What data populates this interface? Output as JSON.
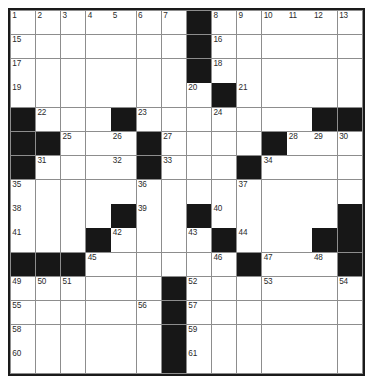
{
  "puzzle": {
    "title": "Crossword Grid",
    "type": "crossword",
    "columns": 14,
    "rows": 15,
    "colors": {
      "block": "#171717",
      "cell": "#ffffff",
      "gridline": "#8d8d8d",
      "border": "#1a1a1a",
      "number_text": "#2b2b2b"
    },
    "legend": {
      "block_label": "blocked square",
      "open_label": "open square"
    },
    "grid": [
      [
        "1",
        "2",
        "3",
        "4",
        "5",
        "6",
        "7",
        "#",
        "8",
        "9",
        "10",
        "11",
        "12",
        "13",
        "14"
      ],
      [
        "15",
        "",
        "",
        "",
        "",
        "",
        "",
        "#",
        "16",
        "",
        "",
        "",
        "",
        "",
        ""
      ],
      [
        "17",
        "",
        "",
        "",
        "",
        "",
        "",
        "#",
        "18",
        "",
        "",
        "",
        "",
        "",
        ""
      ],
      [
        "19",
        "",
        "",
        "",
        "",
        "",
        "",
        "20",
        "21",
        "",
        "",
        "",
        "",
        "",
        ""
      ],
      [
        "#",
        "22",
        "",
        "",
        "#",
        "23",
        "",
        "",
        "24",
        "",
        "",
        "",
        "#",
        "#",
        "#"
      ]
    ],
    "cells": [
      {
        "r": 1,
        "c": 1,
        "n": "1",
        "b": false
      },
      {
        "r": 1,
        "c": 2,
        "n": "2",
        "b": false
      },
      {
        "r": 1,
        "c": 3,
        "n": "3",
        "b": false
      },
      {
        "r": 1,
        "c": 4,
        "n": "4",
        "b": false
      },
      {
        "r": 1,
        "c": 5,
        "n": "5",
        "b": false
      },
      {
        "r": 1,
        "c": 6,
        "n": "6",
        "b": false
      },
      {
        "r": 1,
        "c": 7,
        "n": "7",
        "b": false
      },
      {
        "r": 1,
        "c": 8,
        "n": "",
        "b": true
      },
      {
        "r": 1,
        "c": 9,
        "n": "8",
        "b": false
      },
      {
        "r": 1,
        "c": 10,
        "n": "9",
        "b": false
      },
      {
        "r": 1,
        "c": 11,
        "n": "10",
        "b": false
      },
      {
        "r": 1,
        "c": 12,
        "n": "11",
        "b": false
      },
      {
        "r": 1,
        "c": 13,
        "n": "12",
        "b": false
      },
      {
        "r": 1,
        "c": 14,
        "n": "13",
        "b": false
      },
      {
        "r": 2,
        "c": 1,
        "n": "15",
        "b": false
      },
      {
        "r": 2,
        "c": 2,
        "n": "",
        "b": false
      },
      {
        "r": 2,
        "c": 3,
        "n": "",
        "b": false
      },
      {
        "r": 2,
        "c": 4,
        "n": "",
        "b": false
      },
      {
        "r": 2,
        "c": 5,
        "n": "",
        "b": false
      },
      {
        "r": 2,
        "c": 6,
        "n": "",
        "b": false
      },
      {
        "r": 2,
        "c": 7,
        "n": "",
        "b": false
      },
      {
        "r": 2,
        "c": 8,
        "n": "",
        "b": true
      },
      {
        "r": 2,
        "c": 9,
        "n": "16",
        "b": false
      },
      {
        "r": 2,
        "c": 10,
        "n": "",
        "b": false
      },
      {
        "r": 2,
        "c": 11,
        "n": "",
        "b": false
      },
      {
        "r": 2,
        "c": 12,
        "n": "",
        "b": false
      },
      {
        "r": 2,
        "c": 13,
        "n": "",
        "b": false
      },
      {
        "r": 2,
        "c": 14,
        "n": "",
        "b": false
      },
      {
        "r": 3,
        "c": 1,
        "n": "17",
        "b": false
      },
      {
        "r": 3,
        "c": 2,
        "n": "",
        "b": false
      },
      {
        "r": 3,
        "c": 3,
        "n": "",
        "b": false
      },
      {
        "r": 3,
        "c": 4,
        "n": "",
        "b": false
      },
      {
        "r": 3,
        "c": 5,
        "n": "",
        "b": false
      },
      {
        "r": 3,
        "c": 6,
        "n": "",
        "b": false
      },
      {
        "r": 3,
        "c": 7,
        "n": "",
        "b": false
      },
      {
        "r": 3,
        "c": 8,
        "n": "",
        "b": true
      },
      {
        "r": 3,
        "c": 9,
        "n": "18",
        "b": false
      },
      {
        "r": 3,
        "c": 10,
        "n": "",
        "b": false
      },
      {
        "r": 3,
        "c": 11,
        "n": "",
        "b": false
      },
      {
        "r": 3,
        "c": 12,
        "n": "",
        "b": false
      },
      {
        "r": 3,
        "c": 13,
        "n": "",
        "b": false
      },
      {
        "r": 3,
        "c": 14,
        "n": "",
        "b": false
      },
      {
        "r": 4,
        "c": 1,
        "n": "19",
        "b": false
      },
      {
        "r": 4,
        "c": 2,
        "n": "",
        "b": false
      },
      {
        "r": 4,
        "c": 3,
        "n": "",
        "b": false
      },
      {
        "r": 4,
        "c": 4,
        "n": "",
        "b": false
      },
      {
        "r": 4,
        "c": 5,
        "n": "",
        "b": false
      },
      {
        "r": 4,
        "c": 6,
        "n": "",
        "b": false
      },
      {
        "r": 4,
        "c": 7,
        "n": "",
        "b": false
      },
      {
        "r": 4,
        "c": 8,
        "n": "20",
        "b": false
      },
      {
        "r": 4,
        "c": 9,
        "n": "",
        "b": true
      },
      {
        "r": 4,
        "c": 10,
        "n": "21",
        "b": false
      },
      {
        "r": 4,
        "c": 11,
        "n": "",
        "b": false
      },
      {
        "r": 4,
        "c": 12,
        "n": "",
        "b": false
      },
      {
        "r": 4,
        "c": 13,
        "n": "",
        "b": false
      },
      {
        "r": 4,
        "c": 14,
        "n": "",
        "b": false
      },
      {
        "r": 5,
        "c": 1,
        "n": "",
        "b": true
      },
      {
        "r": 5,
        "c": 2,
        "n": "22",
        "b": false
      },
      {
        "r": 5,
        "c": 3,
        "n": "",
        "b": false
      },
      {
        "r": 5,
        "c": 4,
        "n": "",
        "b": false
      },
      {
        "r": 5,
        "c": 5,
        "n": "",
        "b": true
      },
      {
        "r": 5,
        "c": 6,
        "n": "23",
        "b": false
      },
      {
        "r": 5,
        "c": 7,
        "n": "",
        "b": false
      },
      {
        "r": 5,
        "c": 8,
        "n": "",
        "b": false
      },
      {
        "r": 5,
        "c": 9,
        "n": "24",
        "b": false
      },
      {
        "r": 5,
        "c": 10,
        "n": "",
        "b": false
      },
      {
        "r": 5,
        "c": 11,
        "n": "",
        "b": false
      },
      {
        "r": 5,
        "c": 12,
        "n": "",
        "b": false
      },
      {
        "r": 5,
        "c": 13,
        "n": "",
        "b": true
      },
      {
        "r": 5,
        "c": 14,
        "n": "",
        "b": true
      },
      {
        "r": 6,
        "c": 1,
        "n": "",
        "b": true
      },
      {
        "r": 6,
        "c": 2,
        "n": "",
        "b": true
      },
      {
        "r": 6,
        "c": 3,
        "n": "25",
        "b": false
      },
      {
        "r": 6,
        "c": 4,
        "n": "",
        "b": false
      },
      {
        "r": 6,
        "c": 5,
        "n": "26",
        "b": false
      },
      {
        "r": 6,
        "c": 6,
        "n": "",
        "b": true
      },
      {
        "r": 6,
        "c": 7,
        "n": "27",
        "b": false
      },
      {
        "r": 6,
        "c": 8,
        "n": "",
        "b": false
      },
      {
        "r": 6,
        "c": 9,
        "n": "",
        "b": false
      },
      {
        "r": 6,
        "c": 10,
        "n": "",
        "b": false
      },
      {
        "r": 6,
        "c": 11,
        "n": "",
        "b": true
      },
      {
        "r": 6,
        "c": 12,
        "n": "28",
        "b": false
      },
      {
        "r": 6,
        "c": 13,
        "n": "29",
        "b": false
      },
      {
        "r": 6,
        "c": 14,
        "n": "30",
        "b": false
      },
      {
        "r": 7,
        "c": 1,
        "n": "",
        "b": true
      },
      {
        "r": 7,
        "c": 2,
        "n": "31",
        "b": false
      },
      {
        "r": 7,
        "c": 3,
        "n": "",
        "b": false
      },
      {
        "r": 7,
        "c": 4,
        "n": "",
        "b": false
      },
      {
        "r": 7,
        "c": 5,
        "n": "32",
        "b": false
      },
      {
        "r": 7,
        "c": 6,
        "n": "",
        "b": true
      },
      {
        "r": 7,
        "c": 7,
        "n": "33",
        "b": false
      },
      {
        "r": 7,
        "c": 8,
        "n": "",
        "b": false
      },
      {
        "r": 7,
        "c": 9,
        "n": "",
        "b": false
      },
      {
        "r": 7,
        "c": 10,
        "n": "",
        "b": true
      },
      {
        "r": 7,
        "c": 11,
        "n": "34",
        "b": false
      },
      {
        "r": 7,
        "c": 12,
        "n": "",
        "b": false
      },
      {
        "r": 7,
        "c": 13,
        "n": "",
        "b": false
      },
      {
        "r": 7,
        "c": 14,
        "n": "",
        "b": false
      },
      {
        "r": 8,
        "c": 1,
        "n": "35",
        "b": false
      },
      {
        "r": 8,
        "c": 2,
        "n": "",
        "b": false
      },
      {
        "r": 8,
        "c": 3,
        "n": "",
        "b": false
      },
      {
        "r": 8,
        "c": 4,
        "n": "",
        "b": false
      },
      {
        "r": 8,
        "c": 5,
        "n": "",
        "b": false
      },
      {
        "r": 8,
        "c": 6,
        "n": "36",
        "b": false
      },
      {
        "r": 8,
        "c": 7,
        "n": "",
        "b": false
      },
      {
        "r": 8,
        "c": 8,
        "n": "",
        "b": false
      },
      {
        "r": 8,
        "c": 9,
        "n": "",
        "b": false
      },
      {
        "r": 8,
        "c": 10,
        "n": "37",
        "b": false
      },
      {
        "r": 8,
        "c": 11,
        "n": "",
        "b": false
      },
      {
        "r": 8,
        "c": 12,
        "n": "",
        "b": false
      },
      {
        "r": 8,
        "c": 13,
        "n": "",
        "b": false
      },
      {
        "r": 8,
        "c": 14,
        "n": "",
        "b": false
      },
      {
        "r": 9,
        "c": 1,
        "n": "38",
        "b": false
      },
      {
        "r": 9,
        "c": 2,
        "n": "",
        "b": false
      },
      {
        "r": 9,
        "c": 3,
        "n": "",
        "b": false
      },
      {
        "r": 9,
        "c": 4,
        "n": "",
        "b": false
      },
      {
        "r": 9,
        "c": 5,
        "n": "",
        "b": true
      },
      {
        "r": 9,
        "c": 6,
        "n": "39",
        "b": false
      },
      {
        "r": 9,
        "c": 7,
        "n": "",
        "b": false
      },
      {
        "r": 9,
        "c": 8,
        "n": "",
        "b": true
      },
      {
        "r": 9,
        "c": 9,
        "n": "40",
        "b": false
      },
      {
        "r": 9,
        "c": 10,
        "n": "",
        "b": false
      },
      {
        "r": 9,
        "c": 11,
        "n": "",
        "b": false
      },
      {
        "r": 9,
        "c": 12,
        "n": "",
        "b": false
      },
      {
        "r": 9,
        "c": 13,
        "n": "",
        "b": false
      },
      {
        "r": 9,
        "c": 14,
        "n": "",
        "b": true
      },
      {
        "r": 10,
        "c": 1,
        "n": "41",
        "b": false
      },
      {
        "r": 10,
        "c": 2,
        "n": "",
        "b": false
      },
      {
        "r": 10,
        "c": 3,
        "n": "",
        "b": false
      },
      {
        "r": 10,
        "c": 4,
        "n": "",
        "b": true
      },
      {
        "r": 10,
        "c": 5,
        "n": "42",
        "b": false
      },
      {
        "r": 10,
        "c": 6,
        "n": "",
        "b": false
      },
      {
        "r": 10,
        "c": 7,
        "n": "",
        "b": false
      },
      {
        "r": 10,
        "c": 8,
        "n": "43",
        "b": false
      },
      {
        "r": 10,
        "c": 9,
        "n": "",
        "b": true
      },
      {
        "r": 10,
        "c": 10,
        "n": "44",
        "b": false
      },
      {
        "r": 10,
        "c": 11,
        "n": "",
        "b": false
      },
      {
        "r": 10,
        "c": 12,
        "n": "",
        "b": false
      },
      {
        "r": 10,
        "c": 13,
        "n": "",
        "b": true
      },
      {
        "r": 10,
        "c": 14,
        "n": "",
        "b": true
      },
      {
        "r": 11,
        "c": 1,
        "n": "",
        "b": true
      },
      {
        "r": 11,
        "c": 2,
        "n": "",
        "b": true
      },
      {
        "r": 11,
        "c": 3,
        "n": "",
        "b": true
      },
      {
        "r": 11,
        "c": 4,
        "n": "45",
        "b": false
      },
      {
        "r": 11,
        "c": 5,
        "n": "",
        "b": false
      },
      {
        "r": 11,
        "c": 6,
        "n": "",
        "b": false
      },
      {
        "r": 11,
        "c": 7,
        "n": "",
        "b": false
      },
      {
        "r": 11,
        "c": 8,
        "n": "",
        "b": false
      },
      {
        "r": 11,
        "c": 9,
        "n": "46",
        "b": false
      },
      {
        "r": 11,
        "c": 10,
        "n": "",
        "b": true
      },
      {
        "r": 11,
        "c": 11,
        "n": "47",
        "b": false
      },
      {
        "r": 11,
        "c": 12,
        "n": "",
        "b": false
      },
      {
        "r": 11,
        "c": 13,
        "n": "48",
        "b": false
      },
      {
        "r": 11,
        "c": 14,
        "n": "",
        "b": true
      },
      {
        "r": 12,
        "c": 1,
        "n": "49",
        "b": false
      },
      {
        "r": 12,
        "c": 2,
        "n": "50",
        "b": false
      },
      {
        "r": 12,
        "c": 3,
        "n": "51",
        "b": false
      },
      {
        "r": 12,
        "c": 4,
        "n": "",
        "b": false
      },
      {
        "r": 12,
        "c": 5,
        "n": "",
        "b": false
      },
      {
        "r": 12,
        "c": 6,
        "n": "",
        "b": false
      },
      {
        "r": 12,
        "c": 7,
        "n": "",
        "b": true
      },
      {
        "r": 12,
        "c": 8,
        "n": "52",
        "b": false
      },
      {
        "r": 12,
        "c": 9,
        "n": "",
        "b": false
      },
      {
        "r": 12,
        "c": 10,
        "n": "",
        "b": false
      },
      {
        "r": 12,
        "c": 11,
        "n": "53",
        "b": false
      },
      {
        "r": 12,
        "c": 12,
        "n": "",
        "b": false
      },
      {
        "r": 12,
        "c": 13,
        "n": "",
        "b": false
      },
      {
        "r": 12,
        "c": 14,
        "n": "54",
        "b": false
      },
      {
        "r": 13,
        "c": 1,
        "n": "55",
        "b": false
      },
      {
        "r": 13,
        "c": 2,
        "n": "",
        "b": false
      },
      {
        "r": 13,
        "c": 3,
        "n": "",
        "b": false
      },
      {
        "r": 13,
        "c": 4,
        "n": "",
        "b": false
      },
      {
        "r": 13,
        "c": 5,
        "n": "",
        "b": false
      },
      {
        "r": 13,
        "c": 6,
        "n": "56",
        "b": false
      },
      {
        "r": 13,
        "c": 7,
        "n": "",
        "b": true
      },
      {
        "r": 13,
        "c": 8,
        "n": "57",
        "b": false
      },
      {
        "r": 13,
        "c": 9,
        "n": "",
        "b": false
      },
      {
        "r": 13,
        "c": 10,
        "n": "",
        "b": false
      },
      {
        "r": 13,
        "c": 11,
        "n": "",
        "b": false
      },
      {
        "r": 13,
        "c": 12,
        "n": "",
        "b": false
      },
      {
        "r": 13,
        "c": 13,
        "n": "",
        "b": false
      },
      {
        "r": 13,
        "c": 14,
        "n": "",
        "b": false
      },
      {
        "r": 14,
        "c": 1,
        "n": "58",
        "b": false
      },
      {
        "r": 14,
        "c": 2,
        "n": "",
        "b": false
      },
      {
        "r": 14,
        "c": 3,
        "n": "",
        "b": false
      },
      {
        "r": 14,
        "c": 4,
        "n": "",
        "b": false
      },
      {
        "r": 14,
        "c": 5,
        "n": "",
        "b": false
      },
      {
        "r": 14,
        "c": 6,
        "n": "",
        "b": false
      },
      {
        "r": 14,
        "c": 7,
        "n": "",
        "b": true
      },
      {
        "r": 14,
        "c": 8,
        "n": "59",
        "b": false
      },
      {
        "r": 14,
        "c": 9,
        "n": "",
        "b": false
      },
      {
        "r": 14,
        "c": 10,
        "n": "",
        "b": false
      },
      {
        "r": 14,
        "c": 11,
        "n": "",
        "b": false
      },
      {
        "r": 14,
        "c": 12,
        "n": "",
        "b": false
      },
      {
        "r": 14,
        "c": 13,
        "n": "",
        "b": false
      },
      {
        "r": 14,
        "c": 14,
        "n": "",
        "b": false
      },
      {
        "r": 15,
        "c": 1,
        "n": "60",
        "b": false
      },
      {
        "r": 15,
        "c": 2,
        "n": "",
        "b": false
      },
      {
        "r": 15,
        "c": 3,
        "n": "",
        "b": false
      },
      {
        "r": 15,
        "c": 4,
        "n": "",
        "b": false
      },
      {
        "r": 15,
        "c": 5,
        "n": "",
        "b": false
      },
      {
        "r": 15,
        "c": 6,
        "n": "",
        "b": false
      },
      {
        "r": 15,
        "c": 7,
        "n": "",
        "b": true
      },
      {
        "r": 15,
        "c": 8,
        "n": "61",
        "b": false
      },
      {
        "r": 15,
        "c": 9,
        "n": "",
        "b": false
      },
      {
        "r": 15,
        "c": 10,
        "n": "",
        "b": false
      },
      {
        "r": 15,
        "c": 11,
        "n": "",
        "b": false
      },
      {
        "r": 15,
        "c": 12,
        "n": "",
        "b": false
      },
      {
        "r": 15,
        "c": 13,
        "n": "",
        "b": false
      },
      {
        "r": 15,
        "c": 14,
        "n": "",
        "b": false
      }
    ]
  }
}
